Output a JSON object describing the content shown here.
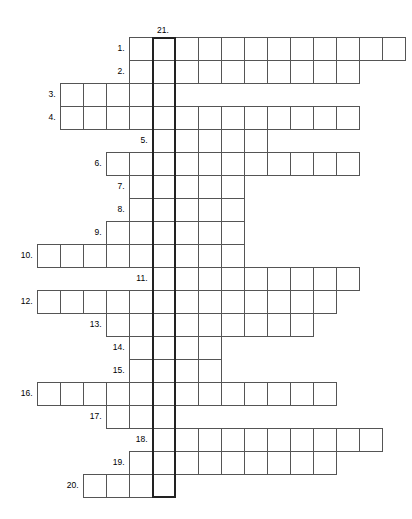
{
  "puzzle": {
    "type": "crossword",
    "title": "",
    "cell_size": 23,
    "origin_x": 13.5,
    "origin_y": 37,
    "grid_columns": 18,
    "grid_rows": 20,
    "border_color": "#555555",
    "key_border_color": "#222222",
    "background": "#ffffff",
    "key_column": {
      "number_label": "21.",
      "column_index": 6,
      "start_row": 0,
      "row_span": 20,
      "cells": 20
    },
    "rows": [
      {
        "number": "1.",
        "start_col": 5,
        "length": 12
      },
      {
        "number": "2.",
        "start_col": 5,
        "length": 10
      },
      {
        "number": "3.",
        "start_col": 2,
        "length": 5
      },
      {
        "number": "4.",
        "start_col": 2,
        "length": 13
      },
      {
        "number": "5.",
        "start_col": 6,
        "length": 5
      },
      {
        "number": "6.",
        "start_col": 4,
        "length": 11
      },
      {
        "number": "7.",
        "start_col": 5,
        "length": 5
      },
      {
        "number": "8.",
        "start_col": 5,
        "length": 5
      },
      {
        "number": "9.",
        "start_col": 4,
        "length": 6
      },
      {
        "number": "10.",
        "start_col": 1,
        "length": 9
      },
      {
        "number": "11.",
        "start_col": 6,
        "length": 9
      },
      {
        "number": "12.",
        "start_col": 1,
        "length": 13
      },
      {
        "number": "13.",
        "start_col": 4,
        "length": 9
      },
      {
        "number": "14.",
        "start_col": 5,
        "length": 4
      },
      {
        "number": "15.",
        "start_col": 5,
        "length": 4
      },
      {
        "number": "16.",
        "start_col": 1,
        "length": 13
      },
      {
        "number": "17.",
        "start_col": 4,
        "length": 3
      },
      {
        "number": "18.",
        "start_col": 6,
        "length": 10
      },
      {
        "number": "19.",
        "start_col": 5,
        "length": 9
      },
      {
        "number": "20.",
        "start_col": 3,
        "length": 4
      }
    ]
  }
}
